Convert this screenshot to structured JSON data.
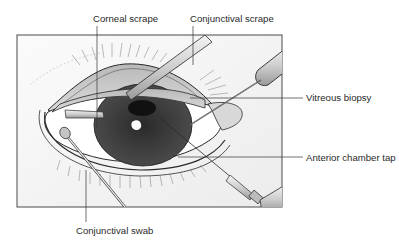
{
  "figure": {
    "labels": {
      "corneal_scrape": "Corneal scrape",
      "conjunctival_scrape": "Conjunctival scrape",
      "vitreous_biopsy": "Vitreous biopsy",
      "anterior_chamber_tap": "Anterior chamber tap",
      "conjunctival_swab": "Conjunctival swab"
    },
    "colors": {
      "frame_border": "#4a4a4a",
      "background": "#f4f4f4",
      "iris": "#3c3c3c",
      "pupil": "#1a1a1a",
      "lid": "#c8c8c8",
      "line": "#333333"
    }
  }
}
